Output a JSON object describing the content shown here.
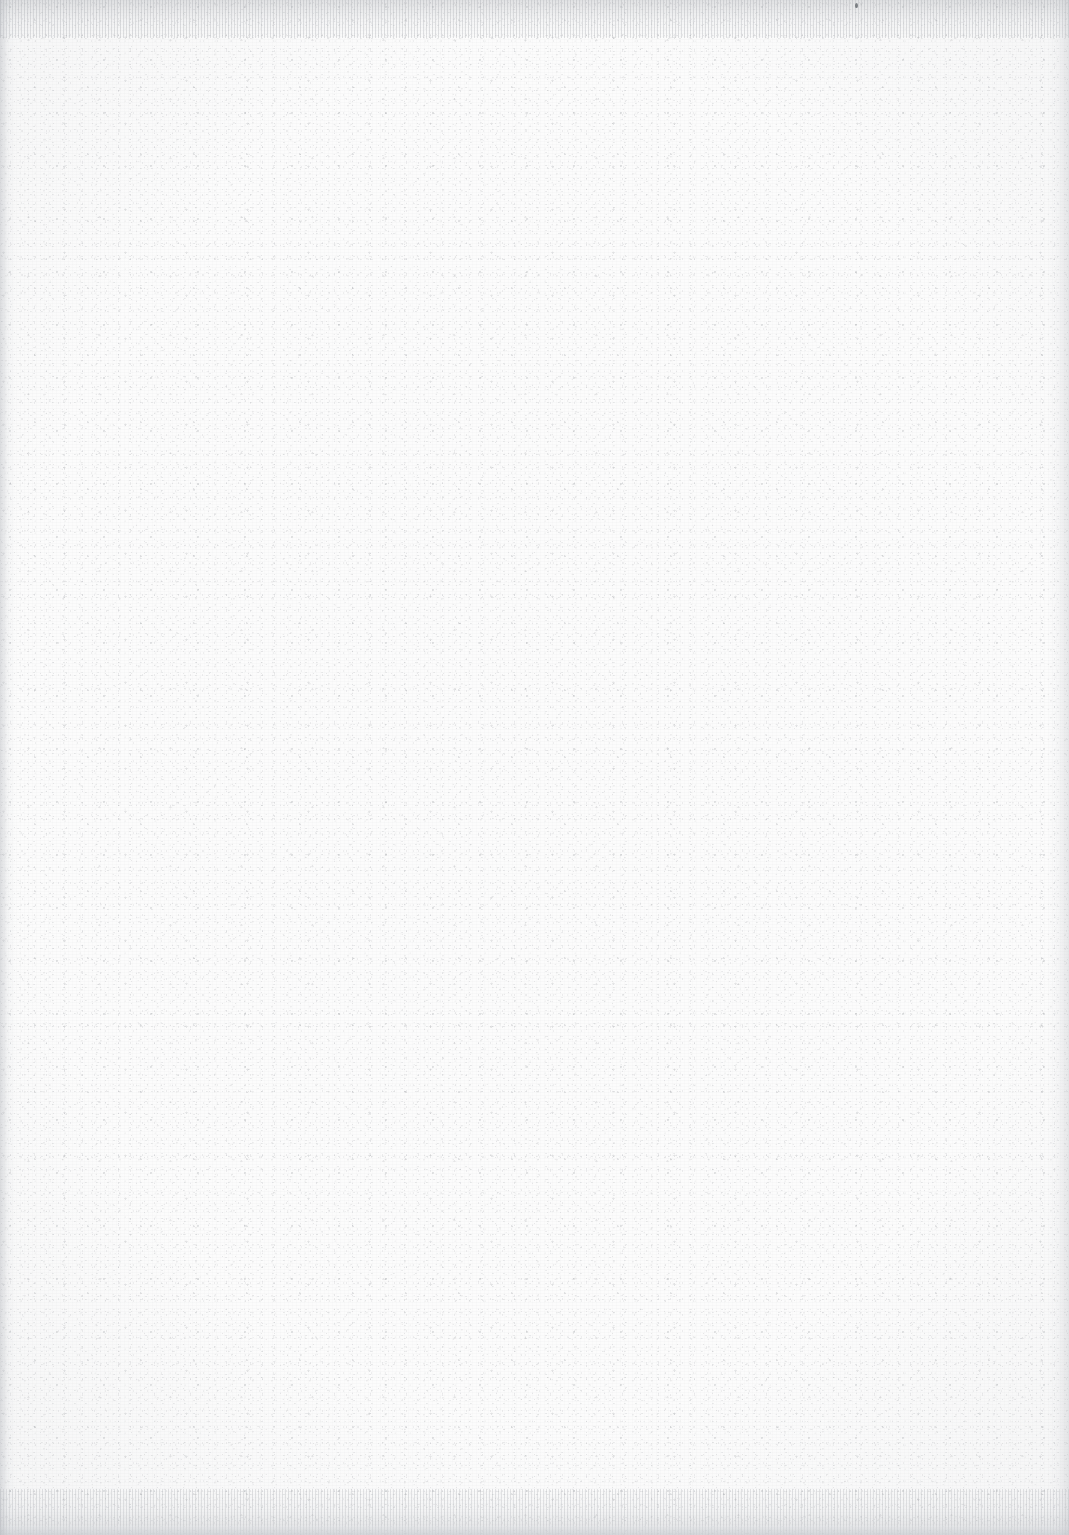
{
  "document": {
    "kind": "scanned-page",
    "content_present": false,
    "visible_text": "",
    "page_width_px": 1069,
    "page_height_px": 1535
  },
  "surface": {
    "description": "blank sheet of paper, no printed or handwritten content",
    "base_color": "#fcfcfc",
    "texture": "fine random paper-fiber speckle",
    "speckle_color": "#7d8186",
    "fleck_color": "#5f646a"
  },
  "scan_artifacts": {
    "top_band": {
      "present": true,
      "height_px": 38,
      "appearance": "vertical streaking, light grey",
      "color": "#a8abb0"
    },
    "bottom_band": {
      "present": true,
      "height_px": 46,
      "appearance": "vertical streaking with flat grey strip at the very edge",
      "color": "#b0b3b8",
      "strip_color": "#ced1d5"
    },
    "left_gutter": {
      "present": true,
      "width_px": 16,
      "appearance": "soft darker vertical shadow band",
      "color": "#b0b3b9"
    },
    "right_gutter": {
      "present": true,
      "width_px": 22,
      "appearance": "faint vertical shadow gradient",
      "color": "#bec1c6"
    },
    "vignette": {
      "present": true,
      "appearance": "corners marginally darker than centre",
      "color": "#b2b5ba"
    },
    "scan_striping": {
      "present": true,
      "appearance": "very faint horizontal and vertical sensor striping",
      "color": "#969ba0"
    }
  },
  "marks": [
    {
      "name": "dark-fleck",
      "x_px": 855,
      "y_px": 3,
      "width_px": 3,
      "height_px": 5,
      "color": "#565a60"
    }
  ]
}
